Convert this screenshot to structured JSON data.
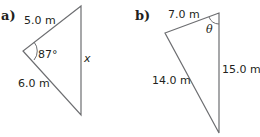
{
  "figures": [
    {
      "part_label": "a)",
      "side_top": "5.0 m",
      "side_bottom": "6.0 m",
      "angle": "87°",
      "side_unknown": "x"
    },
    {
      "part_label": "b)",
      "side_top": "7.0 m",
      "side_left": "14.0 m",
      "side_right": "15.0 m",
      "angle": "θ"
    }
  ],
  "colors": {
    "stroke": "#6d6e71",
    "text": "#231f20"
  }
}
